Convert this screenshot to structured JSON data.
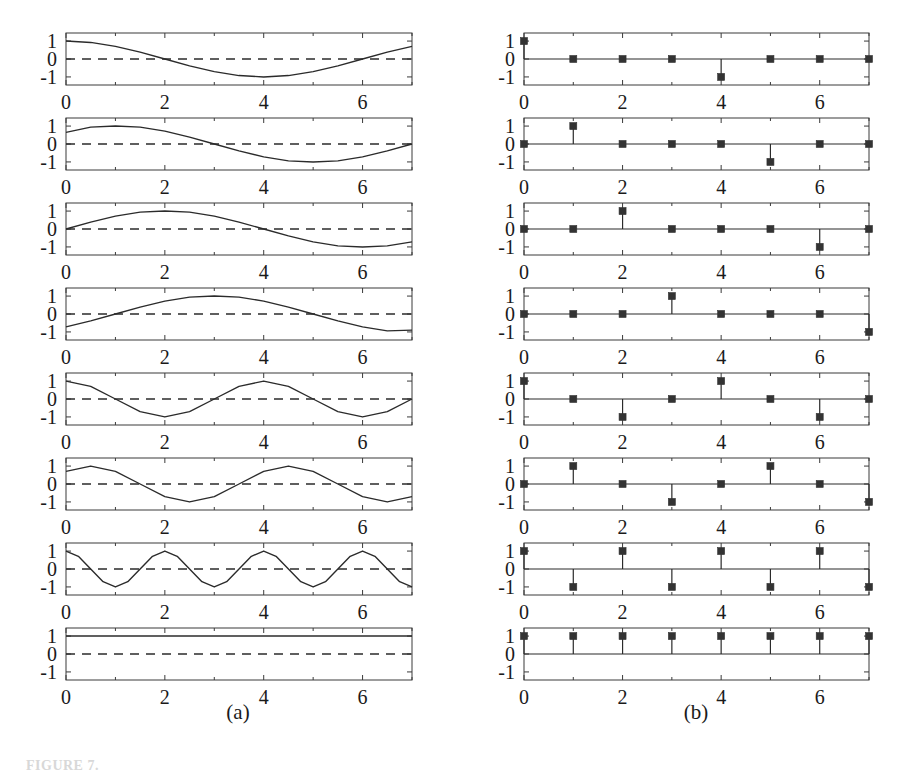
{
  "figure": {
    "columns": [
      {
        "key": "a",
        "label": "(a)",
        "kind": "continuous"
      },
      {
        "key": "b",
        "label": "(b)",
        "kind": "stem"
      }
    ],
    "caption": "FIGURE 7.",
    "rows": 8
  },
  "axes": {
    "xlim": [
      0,
      7
    ],
    "ylim": [
      -1.45,
      1.45
    ],
    "xticks_major": [
      0,
      2,
      4,
      6
    ],
    "xticks_minor": [
      1,
      3,
      5,
      7
    ],
    "xtick_labels": [
      "0",
      "2",
      "4",
      "6"
    ],
    "yticks": [
      1,
      0,
      -1
    ],
    "ytick_labels": [
      "1",
      "0",
      "-1"
    ],
    "grid": false,
    "zero_line_left": "dashed",
    "zero_line_right": "solid",
    "box": true
  },
  "style": {
    "line_color": "#2b2b2b",
    "marker_color": "#333333",
    "axis_color": "#3a3a3a",
    "background": "#ffffff",
    "marker_size": 7,
    "line_width": 1.4
  },
  "chart_data": [
    {
      "type": "line",
      "panel": "a1",
      "title": "",
      "xlabel": "",
      "ylabel": "",
      "xlim": [
        0,
        7
      ],
      "ylim": [
        -1.45,
        1.45
      ],
      "expression": "cos(2*pi*n/8), k=1",
      "x": [
        0,
        0.5,
        1,
        1.5,
        2,
        2.5,
        3,
        3.5,
        4,
        4.5,
        5,
        5.5,
        6,
        6.5,
        7
      ],
      "y": [
        1.0,
        0.924,
        0.707,
        0.383,
        0.0,
        -0.383,
        -0.707,
        -0.924,
        -1.0,
        -0.924,
        -0.707,
        -0.383,
        0.0,
        0.383,
        0.707
      ]
    },
    {
      "type": "stem",
      "panel": "b1",
      "title": "",
      "xlabel": "",
      "ylabel": "",
      "xlim": [
        0,
        7
      ],
      "ylim": [
        -1.45,
        1.45
      ],
      "x": [
        0,
        1,
        2,
        3,
        4,
        5,
        6,
        7
      ],
      "y": [
        1,
        0,
        0,
        0,
        -1,
        0,
        0,
        0
      ]
    },
    {
      "type": "line",
      "panel": "a2",
      "title": "",
      "xlabel": "",
      "ylabel": "",
      "xlim": [
        0,
        7
      ],
      "ylim": [
        -1.45,
        1.45
      ],
      "expression": "sin(2*pi*n/8), k=1",
      "x": [
        0,
        0.5,
        1,
        1.5,
        2,
        2.5,
        3,
        3.5,
        4,
        4.5,
        5,
        5.5,
        6,
        6.5,
        7
      ],
      "y": [
        0.65,
        0.94,
        1.0,
        0.94,
        0.72,
        0.38,
        0.0,
        -0.38,
        -0.72,
        -0.94,
        -1.0,
        -0.94,
        -0.72,
        -0.38,
        0.0
      ]
    },
    {
      "type": "stem",
      "panel": "b2",
      "title": "",
      "xlabel": "",
      "ylabel": "",
      "xlim": [
        0,
        7
      ],
      "ylim": [
        -1.45,
        1.45
      ],
      "x": [
        0,
        1,
        2,
        3,
        4,
        5,
        6,
        7
      ],
      "y": [
        0,
        1,
        0,
        0,
        0,
        -1,
        0,
        0
      ]
    },
    {
      "type": "line",
      "panel": "a3",
      "title": "",
      "xlabel": "",
      "ylabel": "",
      "xlim": [
        0,
        7
      ],
      "ylim": [
        -1.45,
        1.45
      ],
      "expression": "sin(2*pi*n/8) shifted, k=2",
      "x": [
        0,
        0.5,
        1,
        1.5,
        2,
        2.5,
        3,
        3.5,
        4,
        4.5,
        5,
        5.5,
        6,
        6.5,
        7
      ],
      "y": [
        0.0,
        0.38,
        0.72,
        0.94,
        1.0,
        0.94,
        0.72,
        0.38,
        0.0,
        -0.38,
        -0.72,
        -0.94,
        -1.0,
        -0.94,
        -0.72
      ]
    },
    {
      "type": "stem",
      "panel": "b3",
      "title": "",
      "xlabel": "",
      "ylabel": "",
      "xlim": [
        0,
        7
      ],
      "ylim": [
        -1.45,
        1.45
      ],
      "x": [
        0,
        1,
        2,
        3,
        4,
        5,
        6,
        7
      ],
      "y": [
        0,
        0,
        1,
        0,
        0,
        0,
        -1,
        0
      ]
    },
    {
      "type": "line",
      "panel": "a4",
      "title": "",
      "xlabel": "",
      "ylabel": "",
      "xlim": [
        0,
        7
      ],
      "ylim": [
        -1.45,
        1.45
      ],
      "expression": "cos phase shifted, k=3",
      "x": [
        0,
        0.5,
        1,
        1.5,
        2,
        2.5,
        3,
        3.5,
        4,
        4.5,
        5,
        5.5,
        6,
        6.5,
        7
      ],
      "y": [
        -0.72,
        -0.38,
        0.0,
        0.38,
        0.72,
        0.94,
        1.0,
        0.94,
        0.72,
        0.38,
        0.0,
        -0.38,
        -0.72,
        -0.94,
        -0.9
      ]
    },
    {
      "type": "stem",
      "panel": "b4",
      "title": "",
      "xlabel": "",
      "ylabel": "",
      "xlim": [
        0,
        7
      ],
      "ylim": [
        -1.45,
        1.45
      ],
      "x": [
        0,
        1,
        2,
        3,
        4,
        5,
        6,
        7
      ],
      "y": [
        0,
        0,
        0,
        1,
        0,
        0,
        0,
        -1
      ]
    },
    {
      "type": "line",
      "panel": "a5",
      "title": "",
      "xlabel": "",
      "ylabel": "",
      "xlim": [
        0,
        7
      ],
      "ylim": [
        -1.45,
        1.45
      ],
      "expression": "cos(2*pi*n/4), k=2",
      "x": [
        0,
        0.5,
        1,
        1.5,
        2,
        2.5,
        3,
        3.5,
        4,
        4.5,
        5,
        5.5,
        6,
        6.5,
        7
      ],
      "y": [
        1.0,
        0.707,
        0.0,
        -0.707,
        -1.0,
        -0.707,
        0.0,
        0.707,
        1.0,
        0.707,
        0.0,
        -0.707,
        -1.0,
        -0.707,
        0.0
      ]
    },
    {
      "type": "stem",
      "panel": "b5",
      "title": "",
      "xlabel": "",
      "ylabel": "",
      "xlim": [
        0,
        7
      ],
      "ylim": [
        -1.45,
        1.45
      ],
      "x": [
        0,
        1,
        2,
        3,
        4,
        5,
        6,
        7
      ],
      "y": [
        1,
        0,
        -1,
        0,
        1,
        0,
        -1,
        0
      ]
    },
    {
      "type": "line",
      "panel": "a6",
      "title": "",
      "xlabel": "",
      "ylabel": "",
      "xlim": [
        0,
        7
      ],
      "ylim": [
        -1.45,
        1.45
      ],
      "expression": "sin(2*pi*n/4), k=2",
      "x": [
        0,
        0.5,
        1,
        1.5,
        2,
        2.5,
        3,
        3.5,
        4,
        4.5,
        5,
        5.5,
        6,
        6.5,
        7
      ],
      "y": [
        0.707,
        1.0,
        0.707,
        0.0,
        -0.707,
        -1.0,
        -0.707,
        0.0,
        0.707,
        1.0,
        0.707,
        0.0,
        -0.707,
        -1.0,
        -0.707
      ]
    },
    {
      "type": "stem",
      "panel": "b6",
      "title": "",
      "xlabel": "",
      "ylabel": "",
      "xlim": [
        0,
        7
      ],
      "ylim": [
        -1.45,
        1.45
      ],
      "x": [
        0,
        1,
        2,
        3,
        4,
        5,
        6,
        7
      ],
      "y": [
        0,
        1,
        0,
        -1,
        0,
        1,
        0,
        -1
      ]
    },
    {
      "type": "line",
      "panel": "a7",
      "title": "",
      "xlabel": "",
      "ylabel": "",
      "xlim": [
        0,
        7
      ],
      "ylim": [
        -1.45,
        1.45
      ],
      "expression": "cos(pi*n), k=4",
      "x": [
        0,
        0.25,
        0.5,
        0.75,
        1,
        1.25,
        1.5,
        1.75,
        2,
        2.25,
        2.5,
        2.75,
        3,
        3.25,
        3.5,
        3.75,
        4,
        4.25,
        4.5,
        4.75,
        5,
        5.25,
        5.5,
        5.75,
        6,
        6.25,
        6.5,
        6.75,
        7
      ],
      "y": [
        1.0,
        0.707,
        0.0,
        -0.707,
        -1.0,
        -0.707,
        0.0,
        0.707,
        1.0,
        0.707,
        0.0,
        -0.707,
        -1.0,
        -0.707,
        0.0,
        0.707,
        1.0,
        0.707,
        0.0,
        -0.707,
        -1.0,
        -0.707,
        0.0,
        0.707,
        1.0,
        0.707,
        0.0,
        -0.707,
        -1.0
      ]
    },
    {
      "type": "stem",
      "panel": "b7",
      "title": "",
      "xlabel": "",
      "ylabel": "",
      "xlim": [
        0,
        7
      ],
      "ylim": [
        -1.45,
        1.45
      ],
      "x": [
        0,
        1,
        2,
        3,
        4,
        5,
        6,
        7
      ],
      "y": [
        1,
        -1,
        1,
        -1,
        1,
        -1,
        1,
        -1
      ]
    },
    {
      "type": "line",
      "panel": "a8",
      "title": "",
      "xlabel": "",
      "ylabel": "",
      "xlim": [
        0,
        7
      ],
      "ylim": [
        -1.45,
        1.45
      ],
      "expression": "constant DC, k=0",
      "x": [
        0,
        1,
        2,
        3,
        4,
        5,
        6,
        7
      ],
      "y": [
        1,
        1,
        1,
        1,
        1,
        1,
        1,
        1
      ]
    },
    {
      "type": "stem",
      "panel": "b8",
      "title": "",
      "xlabel": "",
      "ylabel": "",
      "xlim": [
        0,
        7
      ],
      "ylim": [
        -1.45,
        1.45
      ],
      "x": [
        0,
        1,
        2,
        3,
        4,
        5,
        6,
        7
      ],
      "y": [
        1,
        1,
        1,
        1,
        1,
        1,
        1,
        1
      ]
    }
  ]
}
